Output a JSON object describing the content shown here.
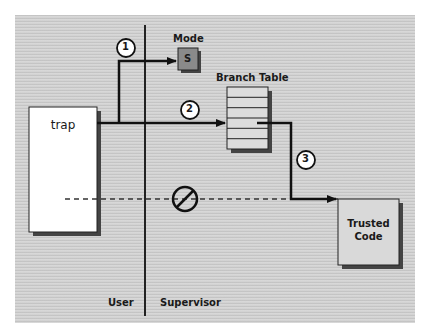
{
  "diagram": {
    "regions": {
      "user_label": "User",
      "supervisor_label": "Supervisor"
    },
    "nodes": {
      "trap": {
        "label": "trap"
      },
      "mode": {
        "title": "Mode",
        "value": "S"
      },
      "branch_table": {
        "title": "Branch Table",
        "rows": 6,
        "selected_row": 4
      },
      "trusted_code": {
        "line1": "Trusted",
        "line2": "Code"
      }
    },
    "steps": [
      {
        "number": "1",
        "description": "trap sets mode to S"
      },
      {
        "number": "2",
        "description": "trap indexes branch table"
      },
      {
        "number": "3",
        "description": "branch table jumps to trusted code"
      }
    ],
    "blocked_path": {
      "icon": "prohibited-icon",
      "style": "dashed"
    },
    "colors": {
      "background": "#cfcfcf",
      "line": "#111111",
      "trap_fill": "#ffffff",
      "mode_fill": "#8a8a8a",
      "table_fill": "#dcdcdc",
      "trusted_fill": "#d9d9d9",
      "shadow": "#444444"
    }
  }
}
